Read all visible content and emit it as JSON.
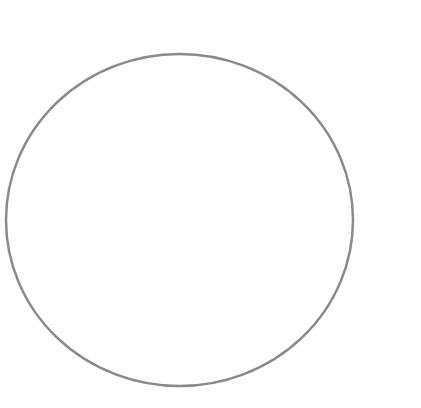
{
  "canvas": {
    "width": 421,
    "height": 408,
    "background": "#ffffff"
  },
  "shapes": [
    {
      "type": "ellipse",
      "label": "circle outline",
      "cx": 179.5,
      "cy": 220,
      "rx": 173.5,
      "ry": 166,
      "fill": "none",
      "stroke": "#8a8a8a",
      "stroke_width": 2.5
    }
  ]
}
